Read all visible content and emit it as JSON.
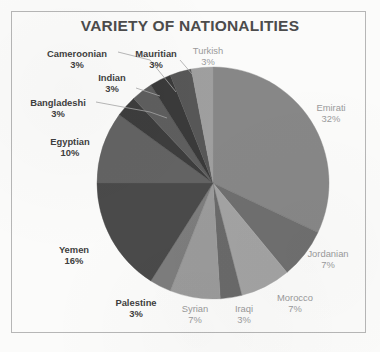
{
  "chart_data": {
    "type": "pie",
    "title": "VARIETY OF NATIONALITIES",
    "xlabel": "",
    "ylabel": "",
    "legend": "none",
    "grid": false,
    "units": "percent",
    "start_angle_deg": 0,
    "direction": "clockwise",
    "categories": [
      "Emirati",
      "Jordanian",
      "Morocco",
      "Iraqi",
      "Syrian",
      "Palestine",
      "Yemen",
      "Egyptian",
      "Bangladeshi",
      "Indian",
      "Cameroonian",
      "Mauritian",
      "Turkish"
    ],
    "values": [
      32,
      7,
      7,
      3,
      7,
      3,
      16,
      10,
      3,
      3,
      3,
      3,
      3
    ],
    "slices": [
      {
        "label": "Emirati",
        "value": 32,
        "value_text": "32%",
        "color": "#878787",
        "label_style": "light",
        "leader": false
      },
      {
        "label": "Jordanian",
        "value": 7,
        "value_text": "7%",
        "color": "#6f6f6f",
        "label_style": "light",
        "leader": false
      },
      {
        "label": "Morocco",
        "value": 7,
        "value_text": "7%",
        "color": "#a3a3a3",
        "label_style": "light",
        "leader": false
      },
      {
        "label": "Iraqi",
        "value": 3,
        "value_text": "3%",
        "color": "#6a6a6a",
        "label_style": "light",
        "leader": false
      },
      {
        "label": "Syrian",
        "value": 7,
        "value_text": "7%",
        "color": "#9b9b9b",
        "label_style": "light",
        "leader": false
      },
      {
        "label": "Palestine",
        "value": 3,
        "value_text": "3%",
        "color": "#7d7d7d",
        "label_style": "dark",
        "leader": false
      },
      {
        "label": "Yemen",
        "value": 16,
        "value_text": "16%",
        "color": "#4a4a4a",
        "label_style": "dark",
        "leader": false
      },
      {
        "label": "Egyptian",
        "value": 10,
        "value_text": "10%",
        "color": "#636363",
        "label_style": "dark",
        "leader": false
      },
      {
        "label": "Bangladeshi",
        "value": 3,
        "value_text": "3%",
        "color": "#3d3d3d",
        "label_style": "dark",
        "leader": true
      },
      {
        "label": "Indian",
        "value": 3,
        "value_text": "3%",
        "color": "#5e5e5e",
        "label_style": "dark",
        "leader": true
      },
      {
        "label": "Cameroonian",
        "value": 3,
        "value_text": "3%",
        "color": "#3a3a3a",
        "label_style": "dark",
        "leader": true
      },
      {
        "label": "Mauritian",
        "value": 3,
        "value_text": "3%",
        "color": "#575757",
        "label_style": "dark",
        "leader": true
      },
      {
        "label": "Turkish",
        "value": 3,
        "value_text": "3%",
        "color": "#9f9f9f",
        "label_style": "light",
        "leader": false
      }
    ],
    "palette": [
      "#878787",
      "#6f6f6f",
      "#a3a3a3",
      "#6a6a6a",
      "#9b9b9b",
      "#7d7d7d",
      "#4a4a4a",
      "#636363",
      "#3d3d3d",
      "#5e5e5e",
      "#3a3a3a",
      "#575757",
      "#9f9f9f"
    ],
    "frame_color": "#b6b6b6",
    "title_color": "#4c4c4c",
    "background": "#fbfbfa"
  }
}
